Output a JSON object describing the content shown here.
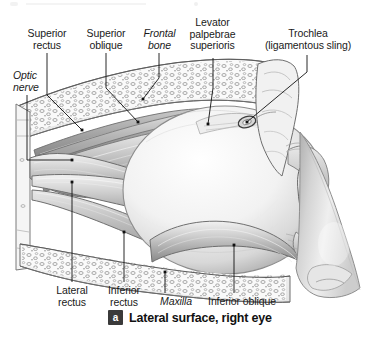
{
  "figure": {
    "title": "Lateral surface, right eye",
    "badge": "a",
    "background_color": "#ffffff",
    "ink_color": "#1a1a1a",
    "leader_color": "#111111"
  },
  "labels": [
    {
      "id": "superior-rectus",
      "text": "Superior\nrectus",
      "style": "normal",
      "x": 18,
      "y": 28,
      "w": 58,
      "align": "center"
    },
    {
      "id": "superior-oblique",
      "text": "Superior\noblique",
      "style": "normal",
      "x": 77,
      "y": 28,
      "w": 58,
      "align": "center"
    },
    {
      "id": "frontal-bone",
      "text": "Frontal\nbone",
      "style": "italic",
      "x": 136,
      "y": 28,
      "w": 47,
      "align": "center"
    },
    {
      "id": "levator-palpebrae",
      "text": "Levator\npalpebrae\nsuperioris",
      "style": "normal",
      "x": 180,
      "y": 17,
      "w": 65,
      "align": "center"
    },
    {
      "id": "trochlea",
      "text": "Trochlea\n(ligamentous sling)",
      "style": "normal",
      "x": 250,
      "y": 28,
      "w": 116,
      "align": "center"
    },
    {
      "id": "optic-nerve",
      "text": "Optic\nnerve",
      "style": "italic",
      "x": 13,
      "y": 70,
      "w": 44,
      "align": "left"
    },
    {
      "id": "lateral-rectus",
      "text": "Lateral\nrectus",
      "style": "normal",
      "x": 48,
      "y": 285,
      "w": 48,
      "align": "center"
    },
    {
      "id": "inferior-rectus",
      "text": "Inferior\nrectus",
      "style": "normal",
      "x": 100,
      "y": 285,
      "w": 48,
      "align": "center"
    },
    {
      "id": "maxilla",
      "text": "Maxilla",
      "style": "italic",
      "x": 152,
      "y": 296,
      "w": 48,
      "align": "center"
    },
    {
      "id": "inferior-oblique",
      "text": "Inferior oblique",
      "style": "normal",
      "x": 199,
      "y": 296,
      "w": 86,
      "align": "center"
    }
  ],
  "leaders": [
    {
      "id": "leader-superior-rectus",
      "points": "47,53 47,95 82,130",
      "dot": "82,130"
    },
    {
      "id": "leader-superior-oblique",
      "points": "106,53 106,88 138,122",
      "dot": "138,122"
    },
    {
      "id": "leader-frontal-bone",
      "points": "159,53 159,78 143,99",
      "dot": "143,99"
    },
    {
      "id": "leader-levator",
      "points": "213,58 213,88 208,124",
      "dot": "208,124"
    },
    {
      "id": "leader-trochlea",
      "points": "307,55 307,72 247,122",
      "dot": "247,122"
    },
    {
      "id": "leader-optic-nerve",
      "points": "27,95 27,160 72,160",
      "dot": "72,160"
    },
    {
      "id": "leader-lateral-rectus",
      "points": "72,282 72,182",
      "dot": "72,182"
    },
    {
      "id": "leader-inferior-rectus",
      "points": "124,282 124,232",
      "dot": "124,232"
    },
    {
      "id": "leader-maxilla",
      "points": "165,293 165,272",
      "dot": "165,272"
    },
    {
      "id": "leader-inferior-oblique",
      "points": "234,293 234,245",
      "dot": "234,245"
    }
  ],
  "illustration": {
    "subject": "lateral view of right orbit with extraocular muscles",
    "structures": [
      "frontal bone (spongy/trabecular)",
      "superior rectus muscle",
      "superior oblique muscle",
      "levator palpebrae superioris",
      "trochlea (ligamentous sling)",
      "optic nerve",
      "lateral rectus muscle",
      "inferior rectus muscle",
      "inferior oblique muscle",
      "maxilla (spongy/trabecular)",
      "eyeball / globe",
      "cornea and iris",
      "eyelids",
      "nose profile"
    ]
  }
}
